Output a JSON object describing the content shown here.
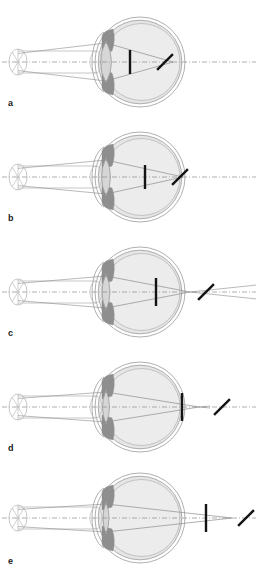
{
  "figure": {
    "background_color": "#ffffff",
    "width": 259,
    "height": 576,
    "colors": {
      "outline": "#9a9a9a",
      "sclera_fill": "#e6e6e6",
      "sclera_inner_fill": "#ececec",
      "iris_fill": "#8e8e8e",
      "lens_fill": "#d6d6d6",
      "ray": "#8c8c8c",
      "axis": "#8c8c8c",
      "bar": "#141414",
      "beam_tube": "#b0b0b0",
      "label": "#1a1a1a"
    }
  },
  "panels": [
    {
      "id": "a",
      "label": "a",
      "label_x": 8,
      "label_y": 106,
      "origin_y": 62,
      "eye_cx": 140,
      "eye_r": 45,
      "lens_half_height": 21,
      "lens_bulge": 11,
      "beam_half_height": 11,
      "vertical_bar_x": 130,
      "vertical_bar_half_height": 12,
      "diagonal_bar_x": 165,
      "diagonal_bar_len": 22,
      "focus_x": 173,
      "axis_x_end": 256,
      "ray_exit_x": 173
    },
    {
      "id": "b",
      "label": "b",
      "label_x": 8,
      "label_y": 221,
      "origin_y": 177,
      "eye_cx": 140,
      "eye_r": 45,
      "lens_half_height": 19,
      "lens_bulge": 9,
      "beam_half_height": 11,
      "vertical_bar_x": 145,
      "vertical_bar_half_height": 12,
      "diagonal_bar_x": 180,
      "diagonal_bar_len": 22,
      "focus_x": 183,
      "axis_x_end": 256,
      "ray_exit_x": 183
    },
    {
      "id": "c",
      "label": "c",
      "label_x": 8,
      "label_y": 336,
      "origin_y": 292,
      "eye_cx": 140,
      "eye_r": 45,
      "lens_half_height": 18,
      "lens_bulge": 8,
      "beam_half_height": 11,
      "vertical_bar_x": 156,
      "vertical_bar_half_height": 14,
      "diagonal_bar_x": 206,
      "diagonal_bar_len": 22,
      "focus_x": 190,
      "axis_x_end": 256,
      "ray_exit_x": 256
    },
    {
      "id": "d",
      "label": "d",
      "label_x": 8,
      "label_y": 451,
      "origin_y": 407,
      "eye_cx": 140,
      "eye_r": 45,
      "lens_half_height": 17,
      "lens_bulge": 7,
      "beam_half_height": 11,
      "vertical_bar_x": 182,
      "vertical_bar_half_height": 14,
      "diagonal_bar_x": 222,
      "diagonal_bar_len": 22,
      "focus_x": 199,
      "axis_x_end": 256,
      "ray_exit_x": 210
    },
    {
      "id": "e",
      "label": "e",
      "label_x": 8,
      "label_y": 564,
      "origin_y": 518,
      "eye_cx": 140,
      "eye_r": 45,
      "lens_half_height": 16,
      "lens_bulge": 6,
      "beam_half_height": 11,
      "vertical_bar_x": 206,
      "vertical_bar_half_height": 14,
      "diagonal_bar_x": 246,
      "diagonal_bar_len": 22,
      "focus_x": 232,
      "axis_x_end": 256,
      "ray_exit_x": 232
    }
  ],
  "beam_source": {
    "cap_x": 18,
    "cap_rx": 9,
    "cap_ry": 13,
    "tube_end_x": 96,
    "tube_half_height": 11
  }
}
